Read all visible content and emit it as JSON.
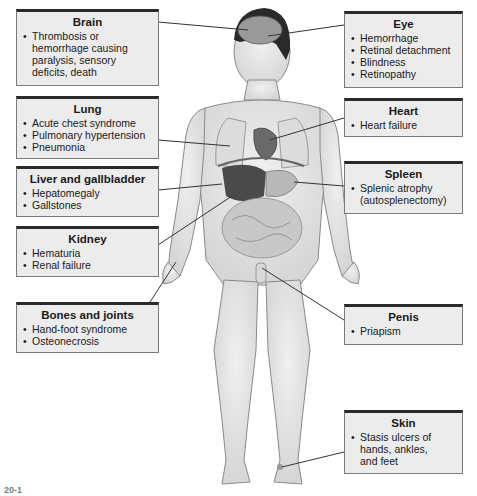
{
  "diagram": {
    "callouts": [
      {
        "id": "brain",
        "title": "Brain",
        "items": [
          "Thrombosis or",
          "hemorrhage causing",
          "paralysis, sensory",
          "deficits, death"
        ],
        "bullets": [
          true,
          false,
          false,
          false
        ]
      },
      {
        "id": "lung",
        "title": "Lung",
        "items": [
          "Acute chest syndrome",
          "Pulmonary hypertension",
          "Pneumonia"
        ],
        "bullets": [
          true,
          true,
          true
        ]
      },
      {
        "id": "liver",
        "title": "Liver and gallbladder",
        "items": [
          "Hepatomegaly",
          "Gallstones"
        ],
        "bullets": [
          true,
          true
        ]
      },
      {
        "id": "kidney",
        "title": "Kidney",
        "items": [
          "Hematuria",
          "Renal failure"
        ],
        "bullets": [
          true,
          true
        ]
      },
      {
        "id": "bones",
        "title": "Bones and joints",
        "items": [
          "Hand-foot syndrome",
          "Osteonecrosis"
        ],
        "bullets": [
          true,
          true
        ]
      },
      {
        "id": "eye",
        "title": "Eye",
        "items": [
          "Hemorrhage",
          "Retinal detachment",
          "Blindness",
          "Retinopathy"
        ],
        "bullets": [
          true,
          true,
          true,
          true
        ]
      },
      {
        "id": "heart",
        "title": "Heart",
        "items": [
          "Heart failure"
        ],
        "bullets": [
          true
        ]
      },
      {
        "id": "spleen",
        "title": "Spleen",
        "items": [
          "Splenic atrophy",
          "(autosplenectomy)"
        ],
        "bullets": [
          true,
          false
        ]
      },
      {
        "id": "penis",
        "title": "Penis",
        "items": [
          "Priapism"
        ],
        "bullets": [
          true
        ]
      },
      {
        "id": "skin",
        "title": "Skin",
        "items": [
          "Stasis ulcers of",
          "hands, ankles,",
          "and feet"
        ],
        "bullets": [
          true,
          false,
          false
        ]
      }
    ]
  },
  "caption": {
    "label": "20-1",
    "text": "(caption text cut off at image edge)"
  },
  "colors": {
    "box_fill": "#ececec",
    "box_top_border": "#2b2b2b",
    "box_border": "#7a7a7a",
    "skin": "#e4e4e4",
    "organ_dark": "#4a4a4a",
    "hair": "#2a2a2a",
    "leader_line": "#333333"
  }
}
